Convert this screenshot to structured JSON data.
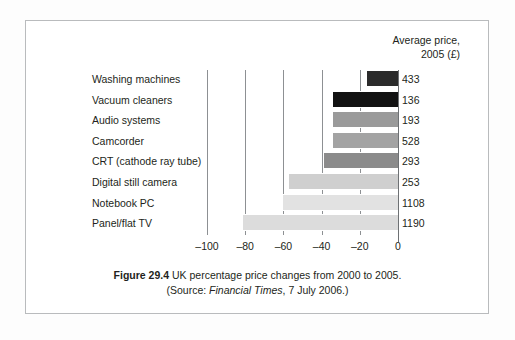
{
  "figure": {
    "column_header_line1": "Average price,",
    "column_header_line2": "2005 (£)",
    "caption_label": "Figure 29.4",
    "caption_text": "UK percentage price changes from 2000 to 2005.",
    "caption_source_prefix": "(Source: ",
    "caption_source_italic": "Financial Times",
    "caption_source_suffix": ", 7 July 2006.)"
  },
  "chart_data": {
    "type": "bar",
    "orientation": "horizontal",
    "title": "UK percentage price changes from 2000 to 2005.",
    "xlabel": "",
    "ylabel": "",
    "xlim": [
      -100,
      0
    ],
    "xticks": [
      -100,
      -80,
      -60,
      -40,
      -20,
      0
    ],
    "xticklabels": [
      "–100",
      "–80",
      "–60",
      "–40",
      "–20",
      "0"
    ],
    "grid": true,
    "legend": false,
    "categories": [
      "Washing machines",
      "Vacuum cleaners",
      "Audio systems",
      "Camcorder",
      "CRT (cathode ray tube)",
      "Digital still camera",
      "Notebook PC",
      "Panel/flat TV"
    ],
    "values": [
      -16,
      -34,
      -34,
      -34,
      -39,
      -57,
      -60,
      -81
    ],
    "value_unit": "percent change 2000-2005",
    "annotations": {
      "label": "Average price, 2005 (£)",
      "values": [
        433,
        136,
        193,
        528,
        293,
        253,
        1108,
        1190
      ]
    },
    "bar_colors": [
      "#2b2b2b",
      "#121212",
      "#9a9a9a",
      "#a3a3a3",
      "#8b8b8b",
      "#cfcfcf",
      "#e2e2e2",
      "#dcdcdc"
    ],
    "series": [
      {
        "name": "Percentage price change",
        "values": [
          -16,
          -34,
          -34,
          -34,
          -39,
          -57,
          -60,
          -81
        ]
      }
    ]
  }
}
